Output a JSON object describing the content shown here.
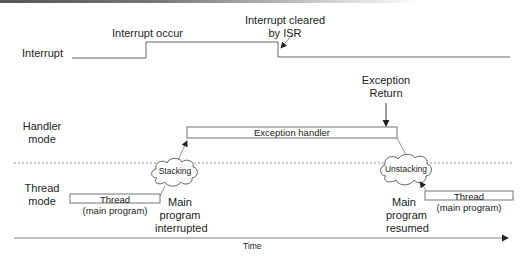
{
  "diagram": {
    "rows": {
      "interrupt": "Interrupt",
      "handler_mode": [
        "Handler",
        "mode"
      ],
      "thread_mode": [
        "Thread",
        "mode"
      ]
    },
    "annotations": {
      "interrupt_occur": "Interrupt occur",
      "interrupt_cleared": [
        "Interrupt cleared",
        "by ISR"
      ],
      "exception_return": [
        "Exception",
        "Return"
      ],
      "main_interrupted": [
        "Main",
        "program",
        "interrupted"
      ],
      "main_resumed": [
        "Main",
        "program",
        "resumed"
      ]
    },
    "boxes": {
      "exception_handler": "Exception handler",
      "thread_left": [
        "Thread",
        "(main program)"
      ],
      "thread_right": [
        "Thread",
        "(main program)"
      ]
    },
    "clouds": {
      "stacking": "Stacking",
      "unstacking": "Unstacking"
    },
    "axis": {
      "label": "Time"
    }
  },
  "colors": {
    "line": "#555555",
    "dotted": "#888888",
    "text": "#222222"
  }
}
